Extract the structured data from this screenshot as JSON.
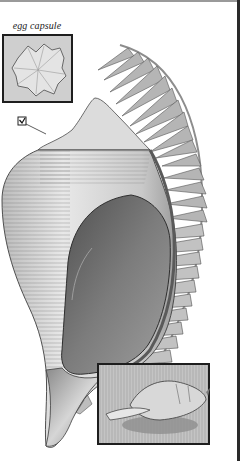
{
  "illustration": {
    "subject": "whelk shell with egg capsule string",
    "caption_label": "egg capsule",
    "insets": [
      {
        "name": "egg-capsule-detail",
        "label": "egg capsule"
      },
      {
        "name": "live-animal-detail",
        "label": ""
      }
    ],
    "marker": "checkbox-marker"
  },
  "colors": {
    "background": "#ffffff",
    "ink_dark": "#2a2a2a",
    "shell_light": "#e6e6e6",
    "shell_mid": "#a8a8a8",
    "aperture_dark": "#6f6f6f",
    "inset_bg": "#bdbdbd"
  }
}
